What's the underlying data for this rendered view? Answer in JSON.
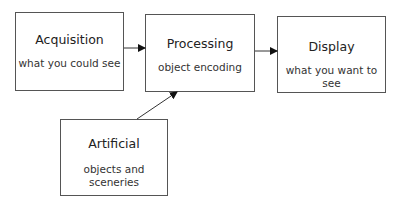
{
  "diagram": {
    "nodes": [
      {
        "id": "acquisition",
        "title": "Acquisition",
        "subtitle": "what you could see"
      },
      {
        "id": "processing",
        "title": "Processing",
        "subtitle": "object encoding"
      },
      {
        "id": "display",
        "title": "Display",
        "subtitle": "what you want to see"
      },
      {
        "id": "artificial",
        "title": "Artificial",
        "subtitle": "objects and sceneries"
      }
    ],
    "edges": [
      {
        "from": "acquisition",
        "to": "processing"
      },
      {
        "from": "processing",
        "to": "display"
      },
      {
        "from": "artificial",
        "to": "processing"
      }
    ]
  }
}
